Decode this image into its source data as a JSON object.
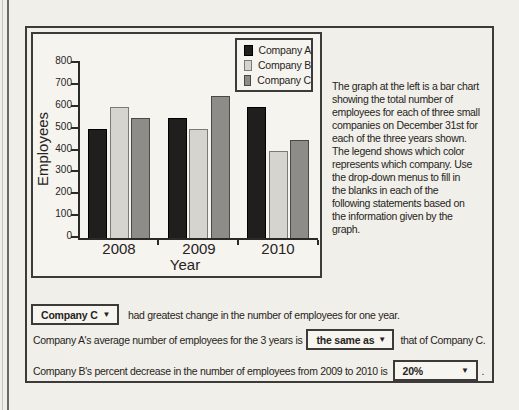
{
  "chart_data": {
    "type": "bar",
    "title": "",
    "categories": [
      "2008",
      "2009",
      "2010"
    ],
    "series": [
      {
        "name": "Company A",
        "color": "#211f1d",
        "border": "#000000",
        "values": [
          500,
          550,
          600
        ]
      },
      {
        "name": "Company B",
        "color": "#d6d4cf",
        "border": "#7c7a76",
        "values": [
          600,
          500,
          400
        ]
      },
      {
        "name": "Company C",
        "color": "#8d8c88",
        "border": "#4a4944",
        "values": [
          550,
          650,
          450
        ]
      }
    ],
    "xlabel": "Year",
    "ylabel": "Employees",
    "ylim": [
      0,
      800
    ],
    "ytick_step": 100,
    "grid": false,
    "legend_position": "top-right"
  },
  "description": {
    "lines": [
      "The graph at the left is a bar chart",
      "showing the total number of",
      "employees for each of three small",
      "companies on December 31st for",
      "each of the three years shown.",
      "The legend shows which color",
      "represents which company. Use",
      "the drop-down menus to fill in",
      "the blanks in each of the",
      "following statements based on",
      "the information given by the",
      "graph."
    ]
  },
  "statements": [
    {
      "dropdown_value": "Company C",
      "text_after": "had greatest change in the number of employees for one year."
    },
    {
      "text_before": "Company A's average number of employees for the 3 years is",
      "dropdown_value": "the same as",
      "text_after": "that of Company C."
    },
    {
      "text_before": "Company B's percent decrease in the number of employees from 2009 to 2010 is",
      "dropdown_value": "20%",
      "text_after": "."
    }
  ],
  "icons": {
    "dropdown_arrow": "▼"
  },
  "colors": {
    "page_bg": "#f1efe9",
    "panel_bg": "#f6f4ef",
    "border_dark": "#3c3b39",
    "text": "#262422"
  }
}
